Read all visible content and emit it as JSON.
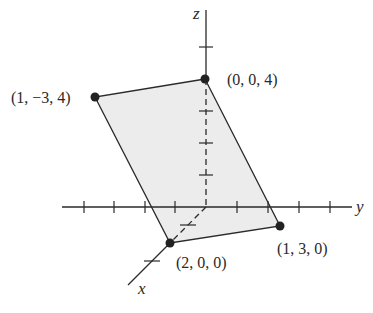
{
  "diagram": {
    "type": "3d-coordinate-plot",
    "axes": {
      "x": {
        "label": "x"
      },
      "y": {
        "label": "y"
      },
      "z": {
        "label": "z"
      }
    },
    "plane": {
      "description": "Shaded parallelogram through four points",
      "fill": "#ececec",
      "vertices": [
        {
          "coords": [
            1,
            -3,
            4
          ],
          "label": "(1, −3, 4)"
        },
        {
          "coords": [
            0,
            0,
            4
          ],
          "label": "(0, 0, 4)"
        },
        {
          "coords": [
            1,
            3,
            0
          ],
          "label": "(1, 3, 0)"
        },
        {
          "coords": [
            2,
            0,
            0
          ],
          "label": "(2, 0, 0)"
        }
      ]
    },
    "ticks": {
      "y_negative": 4,
      "y_positive": 4,
      "z_positive": 5,
      "x_positive": 2
    }
  }
}
